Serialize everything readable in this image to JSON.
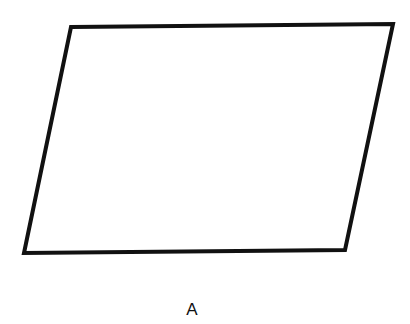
{
  "diagram": {
    "shape": "parallelogram",
    "label": "A",
    "stroke_color": "#111111",
    "fill_color": "#ffffff",
    "stroke_width": 4,
    "vertices": [
      {
        "name": "top-left",
        "x": 71,
        "y": 27
      },
      {
        "name": "top-right",
        "x": 393,
        "y": 24
      },
      {
        "name": "bottom-right",
        "x": 345,
        "y": 250
      },
      {
        "name": "bottom-left",
        "x": 24,
        "y": 253
      }
    ]
  }
}
